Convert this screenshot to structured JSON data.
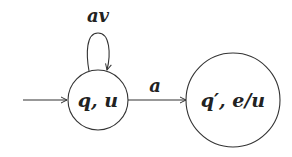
{
  "diagram": {
    "type": "automaton",
    "states": [
      {
        "id": "s0",
        "label": "q, u",
        "initial": true
      },
      {
        "id": "s1",
        "label": "q′, e/u",
        "initial": false
      }
    ],
    "transitions": [
      {
        "from": "s0",
        "to": "s0",
        "label": "av"
      },
      {
        "from": "s0",
        "to": "s1",
        "label": "a"
      }
    ]
  },
  "colors": {
    "stroke": "#333333",
    "text": "#222222",
    "background": "#ffffff"
  }
}
